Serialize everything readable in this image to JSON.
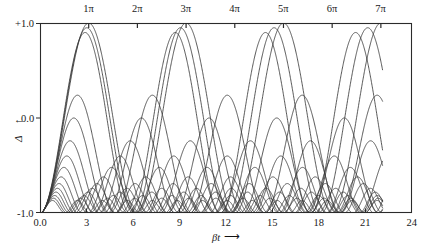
{
  "chart_data": {
    "type": "line",
    "title": "",
    "xlabel": "βt",
    "ylabel": "Δ",
    "xlim": [
      0,
      24
    ],
    "ylim": [
      -1.0,
      1.0
    ],
    "grid": false,
    "legend": "none",
    "x_ticks": [
      "0.0",
      "3",
      "6",
      "9",
      "12",
      "15",
      "18",
      "21",
      "24"
    ],
    "x_tick_values": [
      0,
      3,
      6,
      9,
      12,
      15,
      18,
      21,
      24
    ],
    "y_ticks": [
      "+1.0",
      "0.0",
      "-1.0"
    ],
    "y_tick_values": [
      1.0,
      0.0,
      -1.0
    ],
    "top_axis_label": "",
    "top_ticks": [
      "1π",
      "2π",
      "3π",
      "4π",
      "5π",
      "6π",
      "7π"
    ],
    "top_tick_values": [
      3.14159,
      6.28319,
      9.42478,
      12.56637,
      15.70796,
      18.84956,
      21.99115
    ],
    "x_arrow": "⟶",
    "y_arrow": "↑",
    "line_color": "#3a3a3a",
    "frame_color": "#2b2b2b",
    "background": "#ffffff",
    "x_end_of_data": 22.1,
    "series": [
      {
        "name": "detuning-0",
        "amplitude": 1.0,
        "omega": 1.0,
        "phase": 0.0
      },
      {
        "name": "detuning-1",
        "amplitude": 0.975,
        "omega": 1.04,
        "phase": 0.0
      },
      {
        "name": "detuning-2",
        "amplitude": 0.95,
        "omega": 1.08,
        "phase": 0.0
      },
      {
        "name": "detuning-3",
        "amplitude": 0.62,
        "omega": 1.3,
        "phase": 0.0
      },
      {
        "name": "detuning-4",
        "amplitude": 0.5,
        "omega": 1.44,
        "phase": 0.0
      },
      {
        "name": "detuning-5",
        "amplitude": 0.38,
        "omega": 1.62,
        "phase": 0.0
      },
      {
        "name": "detuning-6",
        "amplitude": 0.3,
        "omega": 1.82,
        "phase": 0.0
      },
      {
        "name": "detuning-7",
        "amplitude": 0.24,
        "omega": 2.04,
        "phase": 0.0
      },
      {
        "name": "detuning-8",
        "amplitude": 0.19,
        "omega": 2.3,
        "phase": 0.0
      },
      {
        "name": "detuning-9",
        "amplitude": 0.155,
        "omega": 2.56,
        "phase": 0.0
      },
      {
        "name": "detuning-10",
        "amplitude": 0.13,
        "omega": 2.8,
        "phase": 0.0
      },
      {
        "name": "detuning-11",
        "amplitude": 0.11,
        "omega": 3.05,
        "phase": 0.0
      },
      {
        "name": "detuning-12",
        "amplitude": 0.092,
        "omega": 3.32,
        "phase": 0.0
      },
      {
        "name": "detuning-13",
        "amplitude": 0.078,
        "omega": 3.6,
        "phase": 0.0
      },
      {
        "name": "detuning-14",
        "amplitude": 0.066,
        "omega": 3.9,
        "phase": 0.0
      }
    ]
  },
  "figure": {
    "plot_left": 40,
    "plot_right": 412,
    "plot_top": 23,
    "plot_bottom": 213
  }
}
